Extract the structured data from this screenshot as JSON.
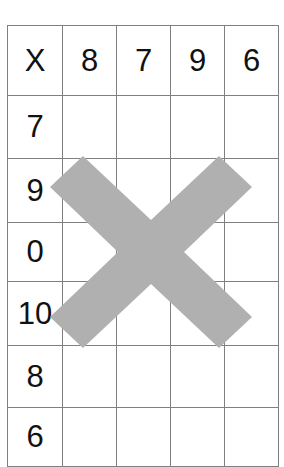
{
  "worksheet": {
    "title": "Multiplication grid worksheet",
    "grid": {
      "columns": 5,
      "rows": 7,
      "header": [
        "X",
        "8",
        "7",
        "9",
        "6"
      ],
      "row_labels": [
        "X",
        "7",
        "9",
        "0",
        "10",
        "8",
        "6"
      ],
      "cells": [
        [
          "X",
          "8",
          "7",
          "9",
          "6"
        ],
        [
          "7",
          "",
          "",
          "",
          ""
        ],
        [
          "9",
          "",
          "",
          "",
          ""
        ],
        [
          "0",
          "",
          "",
          "",
          ""
        ],
        [
          "10",
          "",
          "",
          "",
          ""
        ],
        [
          "8",
          "",
          "",
          "",
          ""
        ],
        [
          "6",
          "",
          "",
          "",
          ""
        ]
      ]
    },
    "annotation": {
      "type": "cross-mark",
      "label": "X",
      "color": "#b0b0b0",
      "border_color": "#808080",
      "text_color": "#111111",
      "background_color": "#ffffff"
    }
  }
}
